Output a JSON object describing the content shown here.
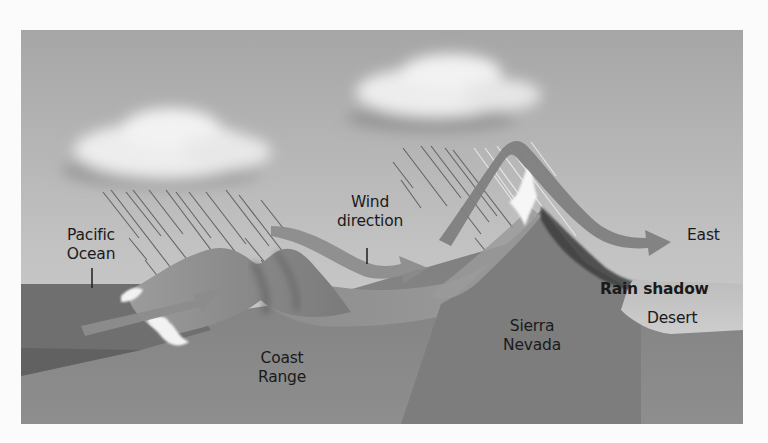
{
  "diagram": {
    "type": "rain-shadow-cross-section",
    "colors": {
      "page_background": "#fbfbfb",
      "sky_top": "#a9a9a9",
      "sky_bottom": "#cfcfcf",
      "ocean": "#707070",
      "ground": "#7c7c7c",
      "mountain_dark": "#6a6a6a",
      "mountain_light": "#9a9a9a",
      "wind_arrow": "#8a8a8a",
      "desert": "#c6c6c6",
      "snow": "#f4f4f4",
      "cloud": "#eeeeee",
      "text": "#1a1a1a"
    },
    "labels": {
      "wind_direction_line1": "Wind",
      "wind_direction_line2": "direction",
      "pacific_line1": "Pacific",
      "pacific_line2": "Ocean",
      "east": "East",
      "rain_shadow": "Rain shadow",
      "desert": "Desert",
      "coast_line1": "Coast",
      "coast_line2": "Range",
      "sierra_line1": "Sierra",
      "sierra_line2": "Nevada"
    },
    "elements": {
      "clouds": [
        "cloud-over-coast-range",
        "cloud-over-sierra-nevada"
      ],
      "rain": [
        "rain-over-coast-range",
        "rain-over-sierra-nevada"
      ],
      "landforms": [
        "pacific-ocean",
        "coast-range",
        "central-valley",
        "sierra-nevada",
        "rain-shadow-desert"
      ],
      "arrows": [
        "wind-arrow-onshore",
        "wind-arrow-valley",
        "wind-arrow-over-sierra"
      ]
    }
  }
}
